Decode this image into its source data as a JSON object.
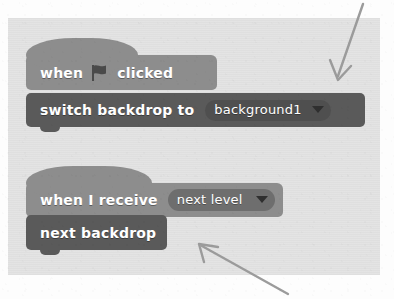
{
  "workspace": {
    "name": "scratch-block-workspace",
    "background_color": "#e3e3e3",
    "page_background_color": "#fdfdfd"
  },
  "colors": {
    "events_block": "#8d8d8d",
    "looks_block": "#5a5a5a",
    "dropdown_on_dark": "#4f4f4f",
    "dropdown_on_light": "#6e6e6e",
    "block_text": "#ffffff",
    "caret": "#2f2f2f",
    "annotation_arrow": "#9a9a9a"
  },
  "scripts": [
    {
      "name": "green-flag-script",
      "blocks": [
        {
          "name": "when-green-flag-clicked-block",
          "type": "hat",
          "category": "events",
          "text_before": "when",
          "icon": "green-flag-icon",
          "text_after": "clicked"
        },
        {
          "name": "switch-backdrop-to-block",
          "type": "command",
          "category": "looks",
          "text_before": "switch  backdrop  to",
          "dropdown": {
            "name": "backdrop-dropdown",
            "value": "background1",
            "caret": "chevron-down-icon"
          }
        }
      ]
    },
    {
      "name": "receive-message-script",
      "blocks": [
        {
          "name": "when-i-receive-block",
          "type": "hat",
          "category": "events",
          "text_before": "when  I  receive",
          "dropdown": {
            "name": "message-dropdown",
            "value": "next level",
            "caret": "chevron-down-icon"
          }
        },
        {
          "name": "next-backdrop-block",
          "type": "command",
          "category": "looks",
          "text_before": "next  backdrop"
        }
      ]
    }
  ],
  "annotations": [
    {
      "name": "annotation-arrow-top-right",
      "points_to": "switch-backdrop-to-block",
      "direction": "down-left"
    },
    {
      "name": "annotation-arrow-bottom",
      "points_to": "next-backdrop-block",
      "direction": "up-left"
    }
  ]
}
